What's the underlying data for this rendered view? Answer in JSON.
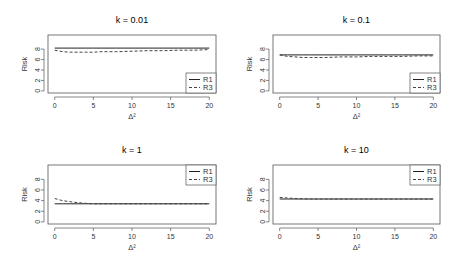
{
  "chart_data": [
    {
      "type": "line",
      "title": "k = 0.01",
      "xlabel": "Δ²",
      "ylabel": "Risk",
      "xlim": [
        0,
        20
      ],
      "ylim": [
        0,
        10
      ],
      "xticks": [
        0,
        5,
        10,
        15,
        20
      ],
      "yticks": [
        0,
        2,
        4,
        6,
        8
      ],
      "legend_position": "bottomright",
      "x": [
        0,
        1,
        2,
        3,
        4,
        5,
        6,
        8,
        10,
        12,
        14,
        16,
        18,
        20
      ],
      "series": [
        {
          "name": "R1",
          "style": "solid",
          "values": [
            8.2,
            8.2,
            8.2,
            8.2,
            8.2,
            8.2,
            8.2,
            8.2,
            8.2,
            8.2,
            8.2,
            8.2,
            8.2,
            8.2
          ]
        },
        {
          "name": "R3",
          "style": "dashed",
          "values": [
            7.8,
            7.5,
            7.4,
            7.4,
            7.4,
            7.4,
            7.5,
            7.5,
            7.6,
            7.7,
            7.7,
            7.8,
            7.8,
            7.9
          ]
        }
      ]
    },
    {
      "type": "line",
      "title": "k = 0.1",
      "xlabel": "Δ²",
      "ylabel": "Risk",
      "xlim": [
        0,
        20
      ],
      "ylim": [
        0,
        10
      ],
      "xticks": [
        0,
        5,
        10,
        15,
        20
      ],
      "yticks": [
        0,
        2,
        4,
        6,
        8
      ],
      "legend_position": "bottomright",
      "x": [
        0,
        1,
        2,
        3,
        4,
        5,
        6,
        8,
        10,
        12,
        14,
        16,
        18,
        20
      ],
      "series": [
        {
          "name": "R1",
          "style": "solid",
          "values": [
            6.9,
            6.9,
            6.9,
            6.9,
            6.9,
            6.9,
            6.9,
            6.9,
            6.9,
            6.9,
            6.9,
            6.9,
            6.9,
            6.9
          ]
        },
        {
          "name": "R3",
          "style": "dashed",
          "values": [
            6.9,
            6.6,
            6.5,
            6.4,
            6.4,
            6.4,
            6.4,
            6.5,
            6.5,
            6.6,
            6.6,
            6.6,
            6.7,
            6.7
          ]
        }
      ]
    },
    {
      "type": "line",
      "title": "k = 1",
      "xlabel": "Δ²",
      "ylabel": "Risk",
      "xlim": [
        0,
        20
      ],
      "ylim": [
        0,
        10
      ],
      "xticks": [
        0,
        5,
        10,
        15,
        20
      ],
      "yticks": [
        0,
        2,
        4,
        6,
        8
      ],
      "legend_position": "topright",
      "x": [
        0,
        1,
        2,
        3,
        4,
        5,
        6,
        8,
        10,
        12,
        14,
        16,
        18,
        20
      ],
      "series": [
        {
          "name": "R1",
          "style": "solid",
          "values": [
            3.4,
            3.4,
            3.4,
            3.4,
            3.4,
            3.4,
            3.4,
            3.4,
            3.4,
            3.4,
            3.4,
            3.4,
            3.4,
            3.4
          ]
        },
        {
          "name": "R3",
          "style": "dashed",
          "values": [
            4.4,
            4.0,
            3.8,
            3.6,
            3.5,
            3.4,
            3.4,
            3.4,
            3.4,
            3.4,
            3.4,
            3.4,
            3.4,
            3.4
          ]
        }
      ]
    },
    {
      "type": "line",
      "title": "k = 10",
      "xlabel": "Δ²",
      "ylabel": "Risk",
      "xlim": [
        0,
        20
      ],
      "ylim": [
        0,
        10
      ],
      "xticks": [
        0,
        5,
        10,
        15,
        20
      ],
      "yticks": [
        0,
        2,
        4,
        6,
        8
      ],
      "legend_position": "topright",
      "x": [
        0,
        1,
        2,
        3,
        4,
        5,
        6,
        8,
        10,
        12,
        14,
        16,
        18,
        20
      ],
      "series": [
        {
          "name": "R1",
          "style": "solid",
          "values": [
            4.3,
            4.3,
            4.3,
            4.3,
            4.3,
            4.3,
            4.3,
            4.3,
            4.3,
            4.3,
            4.3,
            4.3,
            4.3,
            4.3
          ]
        },
        {
          "name": "R3",
          "style": "dashed",
          "values": [
            4.6,
            4.5,
            4.4,
            4.35,
            4.3,
            4.3,
            4.3,
            4.3,
            4.3,
            4.3,
            4.3,
            4.3,
            4.3,
            4.3
          ]
        }
      ]
    }
  ],
  "legend": {
    "r1": "R1",
    "r3": "R3"
  }
}
